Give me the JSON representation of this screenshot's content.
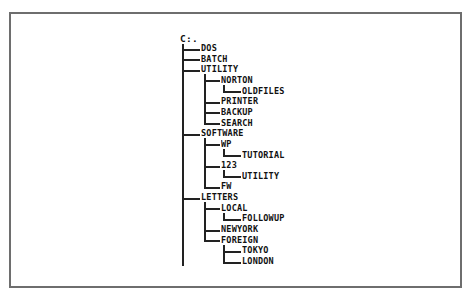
{
  "diagram": {
    "root": "C:.",
    "nodes": [
      {
        "label": "DOS",
        "level": 1
      },
      {
        "label": "BATCH",
        "level": 1
      },
      {
        "label": "UTILITY",
        "level": 1
      },
      {
        "label": "NORTON",
        "level": 2
      },
      {
        "label": "OLDFILES",
        "level": 3
      },
      {
        "label": "PRINTER",
        "level": 2
      },
      {
        "label": "BACKUP",
        "level": 2
      },
      {
        "label": "SEARCH",
        "level": 2
      },
      {
        "label": "SOFTWARE",
        "level": 1
      },
      {
        "label": "WP",
        "level": 2
      },
      {
        "label": "TUTORIAL",
        "level": 3
      },
      {
        "label": "123",
        "level": 2
      },
      {
        "label": "UTILITY",
        "level": 3
      },
      {
        "label": "FW",
        "level": 2
      },
      {
        "label": "LETTERS",
        "level": 1
      },
      {
        "label": "LOCAL",
        "level": 2
      },
      {
        "label": "FOLLOWUP",
        "level": 3
      },
      {
        "label": "NEWYORK",
        "level": 2
      },
      {
        "label": "FOREIGN",
        "level": 2
      },
      {
        "label": "TOKYO",
        "level": 3
      },
      {
        "label": "LONDON",
        "level": 3
      }
    ],
    "colors": {
      "line": "#222222",
      "text": "#111111",
      "frame": "#6e6e6e",
      "background": "#ffffff"
    }
  }
}
